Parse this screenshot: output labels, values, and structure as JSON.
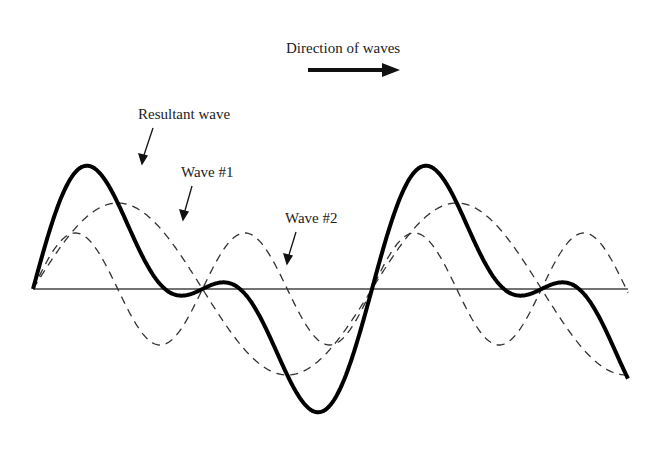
{
  "title": "Direction of waves",
  "labels": {
    "resultant": "Resultant wave",
    "wave1": "Wave #1",
    "wave2": "Wave #2"
  },
  "colors": {
    "line": "#111111",
    "dashed": "#333333",
    "background": "#ffffff"
  },
  "chart_data": {
    "type": "line",
    "title": "Direction of waves",
    "series": [
      {
        "name": "Wave #1",
        "style": "dashed",
        "amplitude": 1.0,
        "frequency": 1,
        "cycles_shown": 1.75
      },
      {
        "name": "Wave #2",
        "style": "dashed",
        "amplitude": 0.66,
        "frequency": 2,
        "cycles_shown": 3.5
      },
      {
        "name": "Resultant wave",
        "style": "solid-thick",
        "formula": "Wave #1 + Wave #2"
      }
    ],
    "axis": {
      "baseline": "horizontal line at zero",
      "grid": false
    },
    "annotation": "Arrow pointing right indicating direction of waves"
  }
}
